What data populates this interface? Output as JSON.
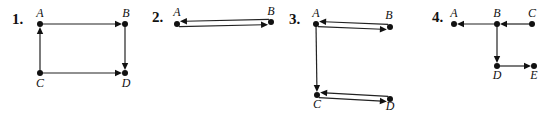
{
  "diagrams": [
    {
      "number": "1.",
      "nodes": [
        {
          "id": "A",
          "label": "A",
          "x": 40,
          "y": 24,
          "lx": 40,
          "ly": 17
        },
        {
          "id": "B",
          "label": "B",
          "x": 125,
          "y": 24,
          "lx": 126,
          "ly": 17
        },
        {
          "id": "C",
          "label": "C",
          "x": 40,
          "y": 73,
          "lx": 40,
          "ly": 87
        },
        {
          "id": "D",
          "label": "D",
          "x": 125,
          "y": 73,
          "lx": 126,
          "ly": 87
        }
      ],
      "edges": [
        {
          "from": "A",
          "to": "B"
        },
        {
          "from": "C",
          "to": "A"
        },
        {
          "from": "B",
          "to": "D"
        },
        {
          "from": "C",
          "to": "D"
        }
      ]
    },
    {
      "number": "2.",
      "nodes": [
        {
          "id": "A",
          "label": "A",
          "x": 177,
          "y": 24,
          "lx": 177,
          "ly": 16
        },
        {
          "id": "B",
          "label": "B",
          "x": 271,
          "y": 22,
          "lx": 271,
          "ly": 15
        }
      ],
      "edges": [
        {
          "from": "B",
          "to": "A"
        },
        {
          "from": "A",
          "to": "B"
        }
      ]
    },
    {
      "number": "3.",
      "nodes": [
        {
          "id": "A",
          "label": "A",
          "x": 316,
          "y": 24,
          "lx": 316,
          "ly": 17
        },
        {
          "id": "B",
          "label": "B",
          "x": 390,
          "y": 27,
          "lx": 389,
          "ly": 19
        },
        {
          "id": "C",
          "label": "C",
          "x": 317,
          "y": 95,
          "lx": 317,
          "ly": 108
        },
        {
          "id": "D",
          "label": "D",
          "x": 390,
          "y": 99,
          "lx": 390,
          "ly": 110
        }
      ],
      "edges": [
        {
          "from": "A",
          "to": "B"
        },
        {
          "from": "B",
          "to": "A"
        },
        {
          "from": "A",
          "to": "C"
        },
        {
          "from": "C",
          "to": "D"
        },
        {
          "from": "D",
          "to": "C"
        }
      ]
    },
    {
      "number": "4.",
      "nodes": [
        {
          "id": "A",
          "label": "A",
          "x": 454,
          "y": 24,
          "lx": 454,
          "ly": 17
        },
        {
          "id": "B",
          "label": "B",
          "x": 497,
          "y": 24,
          "lx": 497,
          "ly": 17
        },
        {
          "id": "C",
          "label": "C",
          "x": 532,
          "y": 24,
          "lx": 532,
          "ly": 17
        },
        {
          "id": "D",
          "label": "D",
          "x": 497,
          "y": 66,
          "lx": 497,
          "ly": 79
        },
        {
          "id": "E",
          "label": "E",
          "x": 534,
          "y": 66,
          "lx": 534,
          "ly": 79
        }
      ],
      "edges": [
        {
          "from": "B",
          "to": "A"
        },
        {
          "from": "C",
          "to": "B"
        },
        {
          "from": "B",
          "to": "D"
        },
        {
          "from": "D",
          "to": "E"
        }
      ]
    }
  ],
  "numbers_pos": [
    {
      "x": 12,
      "y": 24
    },
    {
      "x": 152,
      "y": 22
    },
    {
      "x": 289,
      "y": 24
    },
    {
      "x": 432,
      "y": 22
    }
  ]
}
